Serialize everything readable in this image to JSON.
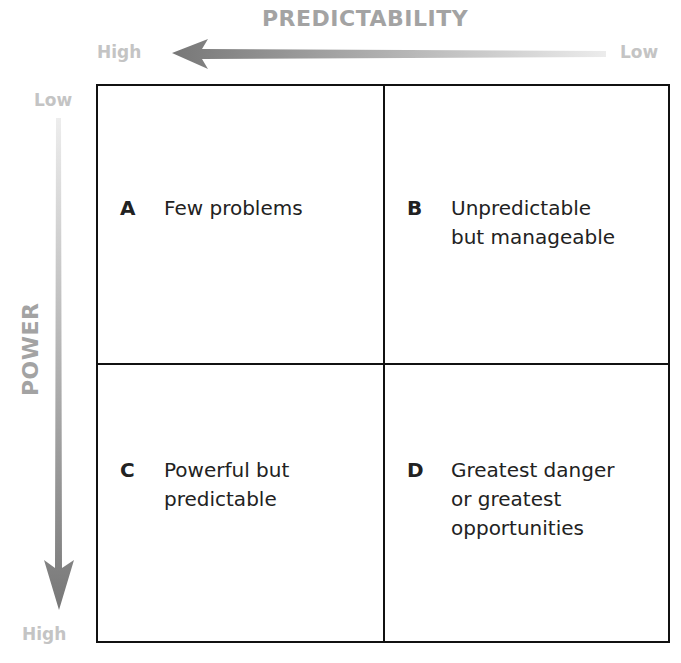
{
  "horizontal_axis": {
    "title": "PREDICTABILITY",
    "left_label": "High",
    "right_label": "Low",
    "arrow_direction": "left"
  },
  "vertical_axis": {
    "title": "POWER",
    "top_label": "Low",
    "bottom_label": "High",
    "arrow_direction": "down"
  },
  "quadrants": [
    {
      "letter": "A",
      "text": "Few problems"
    },
    {
      "letter": "B",
      "text": "Unpredictable\nbut manageable"
    },
    {
      "letter": "C",
      "text": "Powerful but\npredictable"
    },
    {
      "letter": "D",
      "text": "Greatest danger\nor greatest\nopportunities"
    }
  ],
  "colors": {
    "axis_title": "#a3a3a3",
    "axis_end_label": "#c4c4c4",
    "arrow_dark": "#777777",
    "arrow_light": "#e6e6e6",
    "grid_line": "#111111",
    "text": "#222222"
  }
}
